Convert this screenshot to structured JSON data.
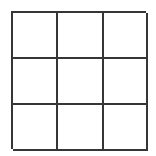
{
  "figure": {
    "title": "",
    "kind": "empty-3x3-grid",
    "rows": 3,
    "columns": 3,
    "line_color": "#363636",
    "cell_fill_color": "#ffffff",
    "background_color": "#ffffff",
    "line_thickness_px": 2,
    "cells": [
      {
        "id": "cell-r1c1",
        "row": 1,
        "column": 1,
        "label": ""
      },
      {
        "id": "cell-r1c2",
        "row": 1,
        "column": 2,
        "label": ""
      },
      {
        "id": "cell-r1c3",
        "row": 1,
        "column": 3,
        "label": ""
      },
      {
        "id": "cell-r2c1",
        "row": 2,
        "column": 1,
        "label": ""
      },
      {
        "id": "cell-r2c2",
        "row": 2,
        "column": 2,
        "label": ""
      },
      {
        "id": "cell-r2c3",
        "row": 2,
        "column": 3,
        "label": ""
      },
      {
        "id": "cell-r3c1",
        "row": 3,
        "column": 1,
        "label": ""
      },
      {
        "id": "cell-r3c2",
        "row": 3,
        "column": 2,
        "label": ""
      },
      {
        "id": "cell-r3c3",
        "row": 3,
        "column": 3,
        "label": ""
      }
    ]
  }
}
